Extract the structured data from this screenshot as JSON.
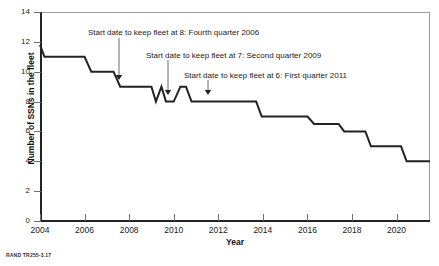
{
  "figure": {
    "source_note": "RAND TR255-3.17"
  },
  "chart_data": {
    "type": "line",
    "title": "",
    "xlabel": "Year",
    "ylabel": "Number of SSNs in the fleet",
    "xlim": [
      2004,
      2021.5
    ],
    "ylim": [
      0,
      14
    ],
    "grid": false,
    "legend": "none",
    "xticks": [
      2004,
      2006,
      2008,
      2010,
      2012,
      2014,
      2016,
      2018,
      2020
    ],
    "xtick_labels": [
      "2004",
      "2006",
      "2008",
      "2010",
      "2012",
      "2014",
      "2016",
      "2018",
      "2020"
    ],
    "yticks": [
      0,
      2,
      4,
      6,
      8,
      10,
      12,
      14
    ],
    "ytick_labels": [
      "0",
      "2",
      "4",
      "6",
      "8",
      "10",
      "12",
      "14"
    ],
    "series": [
      {
        "name": "SSN fleet size",
        "color": "#222222",
        "x": [
          2004.0,
          2004.2,
          2004.45,
          2006.0,
          2006.3,
          2007.0,
          2007.3,
          2007.6,
          2009.0,
          2009.2,
          2009.45,
          2009.65,
          2010.0,
          2010.3,
          2010.55,
          2010.8,
          2011.2,
          2013.7,
          2013.95,
          2016.0,
          2016.3,
          2017.4,
          2017.65,
          2018.6,
          2018.85,
          2020.2,
          2020.45,
          2021.5
        ],
        "y": [
          11.8,
          11.0,
          11.0,
          11.0,
          10.0,
          10.0,
          10.0,
          9.0,
          9.0,
          8.0,
          9.0,
          8.0,
          8.0,
          9.0,
          9.0,
          8.0,
          8.0,
          8.0,
          7.0,
          7.0,
          6.5,
          6.5,
          6.0,
          6.0,
          5.0,
          5.0,
          4.0,
          4.0
        ]
      }
    ],
    "annotations": [
      {
        "text": "Start date to keep fleet at 8: Fourth quarter 2006",
        "label_x": 88,
        "label_y": 28,
        "arrow_x": 119,
        "arrow_y_top": 38,
        "arrow_y_bottom": 80,
        "target_year": 2006.75,
        "target_value": 9
      },
      {
        "text": "Start date to keep fleet at 7: Second quarter 2009",
        "label_x": 146,
        "label_y": 51,
        "arrow_x": 168,
        "arrow_y_top": 60,
        "arrow_y_bottom": 95,
        "target_year": 2009.25,
        "target_value": 8
      },
      {
        "text": "Start date to keep fleet at 6: First quarter 2011",
        "label_x": 184,
        "label_y": 71,
        "arrow_x": 208,
        "arrow_y_top": 80,
        "arrow_y_bottom": 95,
        "target_year": 2011.0,
        "target_value": 8
      }
    ]
  }
}
